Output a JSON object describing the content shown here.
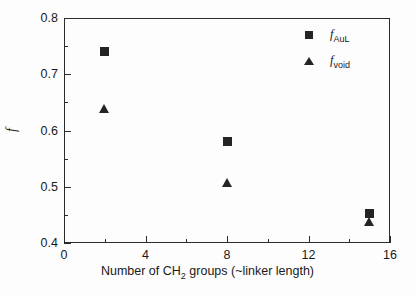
{
  "chart_data": {
    "type": "scatter",
    "title": "",
    "xlabel": "Number of CH2 groups (~linker length)",
    "ylabel": "f",
    "xlim": [
      0,
      16
    ],
    "ylim": [
      0.4,
      0.8
    ],
    "x_ticks": [
      "0",
      "4",
      "8",
      "12",
      "16"
    ],
    "x_tick_values": [
      0,
      4,
      8,
      12,
      16
    ],
    "x_minor_values": [
      2,
      6,
      10,
      14
    ],
    "y_ticks": [
      "0.4",
      "0.5",
      "0.6",
      "0.7",
      "0.8"
    ],
    "y_tick_values": [
      0.4,
      0.5,
      0.6,
      0.7,
      0.8
    ],
    "y_minor_values": [
      0.45,
      0.55,
      0.65,
      0.75
    ],
    "grid": false,
    "legend_position": "top-right",
    "series": [
      {
        "name": "f_AuL",
        "marker": "square",
        "color": "#242424",
        "x": [
          2,
          8,
          15
        ],
        "values": [
          0.74,
          0.581,
          0.452
        ]
      },
      {
        "name": "f_void",
        "marker": "triangle",
        "color": "#242424",
        "x": [
          2,
          8,
          15
        ],
        "values": [
          0.638,
          0.507,
          0.437
        ]
      }
    ]
  },
  "axis": {
    "y_title_symbol": "f",
    "x_title_prefix": "Number of CH",
    "x_title_sub": "2",
    "x_title_suffix": " groups (~linker length)"
  },
  "legend": {
    "entries": [
      {
        "symbol": "square",
        "base": "f",
        "sub": "AuL"
      },
      {
        "symbol": "triangle",
        "base": "f",
        "sub": "void"
      }
    ]
  }
}
